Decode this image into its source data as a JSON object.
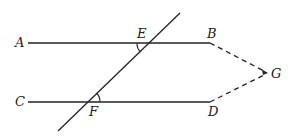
{
  "diagram": {
    "type": "geometry",
    "stroke_color": "#222222",
    "points": {
      "A": {
        "label": "A",
        "x": 28,
        "y": 43
      },
      "B": {
        "label": "B",
        "x": 210,
        "y": 43
      },
      "C": {
        "label": "C",
        "x": 28,
        "y": 102
      },
      "D": {
        "label": "D",
        "x": 210,
        "y": 102
      },
      "E": {
        "label": "E",
        "x": 149,
        "y": 43
      },
      "F": {
        "label": "F",
        "x": 88,
        "y": 102
      },
      "G": {
        "label": "G",
        "x": 268,
        "y": 73
      }
    },
    "segments": [
      {
        "from": "A",
        "to": "B",
        "style": "solid"
      },
      {
        "from": "C",
        "to": "D",
        "style": "solid"
      },
      {
        "from": "B",
        "to": "G",
        "style": "dashed"
      },
      {
        "from": "D",
        "to": "G",
        "style": "dashed"
      }
    ],
    "transversal": {
      "through": [
        "E",
        "F"
      ],
      "style": "solid"
    },
    "angle_marks": [
      {
        "at": "E",
        "between": [
          "EA",
          "EF"
        ]
      },
      {
        "at": "F",
        "between": [
          "FD",
          "FE"
        ]
      }
    ]
  }
}
